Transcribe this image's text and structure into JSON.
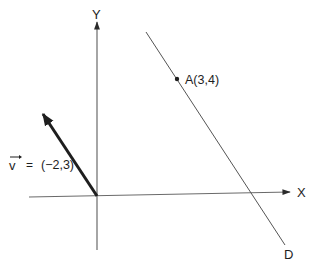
{
  "figure": {
    "axes": {
      "x_label": "X",
      "y_label": "Y"
    },
    "vector": {
      "name": "v",
      "label_eq": "=",
      "label_value": "(−2,3)",
      "components": [
        -2,
        3
      ],
      "color": "#1e1e1e"
    },
    "point": {
      "label": "A(3,4)",
      "coords": [
        3,
        4
      ]
    },
    "line": {
      "label": "D",
      "passes_through": "A",
      "direction_vector": "v"
    },
    "colors": {
      "axis": "#6a6a6a",
      "line": "#555555",
      "text": "#1e1e1e",
      "background": "#ffffff"
    }
  }
}
